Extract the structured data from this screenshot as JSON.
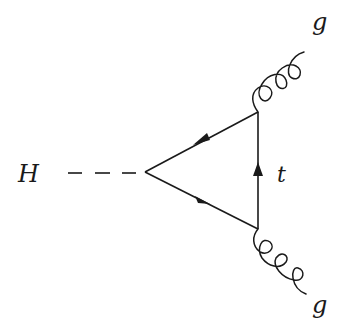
{
  "diagram": {
    "type": "feynman-diagram",
    "process": "Higgs to two gluons via top-quark loop",
    "labels": {
      "higgs": "H",
      "top_quark": "t",
      "gluon_top": "g",
      "gluon_bottom": "g"
    },
    "nodes": {
      "higgs_vertex": {
        "x": 145,
        "y": 172
      },
      "top_right_vertex": {
        "x": 258,
        "y": 112
      },
      "bottom_right_vertex": {
        "x": 258,
        "y": 228
      }
    },
    "edges": [
      {
        "name": "higgs-propagator",
        "style": "dashed",
        "from": "H",
        "to": "higgs_vertex"
      },
      {
        "name": "top-loop-upper",
        "style": "solid-arrow",
        "from": "top_right_vertex",
        "to": "higgs_vertex"
      },
      {
        "name": "top-loop-lower",
        "style": "solid-arrow",
        "from": "higgs_vertex",
        "to": "bottom_right_vertex"
      },
      {
        "name": "top-loop-vertical",
        "style": "solid-arrow",
        "from": "bottom_right_vertex",
        "to": "top_right_vertex"
      },
      {
        "name": "gluon-top",
        "style": "curly",
        "from": "top_right_vertex",
        "to": "g"
      },
      {
        "name": "gluon-bottom",
        "style": "curly",
        "from": "bottom_right_vertex",
        "to": "g"
      }
    ],
    "colors": {
      "line": "#1a1a1a",
      "background": "#ffffff"
    }
  }
}
